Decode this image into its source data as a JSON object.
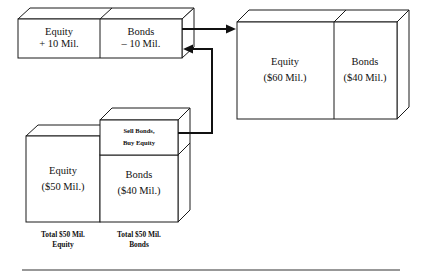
{
  "figure": {
    "title": "Sell Bonds, Buy Equity recapitalization diagram",
    "ink_color": "#111111",
    "fill_color": "#ffffff"
  },
  "change_block": {
    "name": "change-block",
    "equity": {
      "line1": "Equity",
      "line2": "+ 10 Mil."
    },
    "bonds": {
      "line1": "Bonds",
      "line2": "– 10 Mil."
    }
  },
  "result_block": {
    "name": "result-block",
    "equity": {
      "line1": "Equity",
      "line2": "($60 Mil.)"
    },
    "bonds": {
      "line1": "Bonds",
      "line2": "($40 Mil.)"
    }
  },
  "initial_block": {
    "name": "initial-block",
    "equity": {
      "line1": "Equity",
      "line2": "($50 Mil.)"
    },
    "bonds": {
      "line1": "Bonds",
      "line2": "($40 Mil.)"
    },
    "action": {
      "line1": "Sell Bonds,",
      "line2": "Buy Equity"
    },
    "captions": {
      "equity_line1": "Total $50 Mil.",
      "equity_line2": "Equity",
      "bonds_line1": "Total $50 Mil.",
      "bonds_line2": "Bonds"
    }
  },
  "connectors": {
    "top_arrow_label": "change-to-result-arrow",
    "loop_arrow_label": "action-to-change-arrow"
  }
}
